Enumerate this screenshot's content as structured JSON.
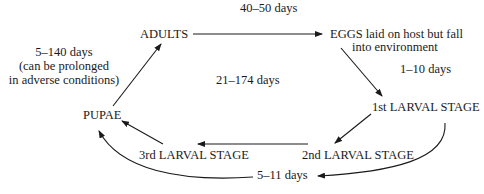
{
  "diagram": {
    "type": "life-cycle",
    "stages": {
      "adults": "ADULTS",
      "eggs_line1": "EGGS laid on host but fall",
      "eggs_line2": "into environment",
      "larva1": "1st LARVAL STAGE",
      "larva2": "2nd LARVAL STAGE",
      "larva3": "3rd LARVAL STAGE",
      "pupae": "PUPAE"
    },
    "durations": {
      "adults_to_eggs": "40–50 days",
      "eggs_to_larva1": "1–10 days",
      "total_cycle": "21–174 days",
      "larval_period": "5–11 days",
      "pupae_to_adults_line1": "5–140 days",
      "pupae_to_adults_line2": "(can be prolonged",
      "pupae_to_adults_line3": "in adverse conditions)"
    },
    "edges": [
      {
        "from": "ADULTS",
        "to": "EGGS"
      },
      {
        "from": "EGGS",
        "to": "1st LARVAL STAGE"
      },
      {
        "from": "1st LARVAL STAGE",
        "to": "2nd LARVAL STAGE"
      },
      {
        "from": "2nd LARVAL STAGE",
        "to": "3rd LARVAL STAGE"
      },
      {
        "from": "3rd LARVAL STAGE",
        "to": "PUPAE"
      },
      {
        "from": "1st LARVAL STAGE",
        "to": "PUPAE",
        "label": "5–11 days",
        "curved": true
      },
      {
        "from": "PUPAE",
        "to": "ADULTS"
      }
    ],
    "colors": {
      "line": "#1a1a1a",
      "text": "#1a1a1a",
      "background": "#ffffff"
    }
  }
}
